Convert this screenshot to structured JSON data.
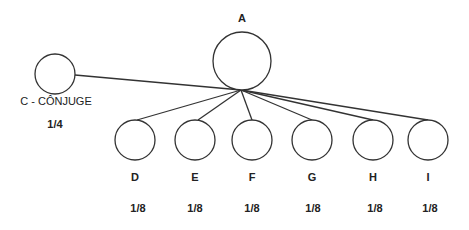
{
  "diagram": {
    "type": "inheritance-tree",
    "colors": {
      "stroke": "#333333",
      "text": "#222222",
      "background": "#ffffff"
    },
    "root": {
      "id": "A",
      "label": "A"
    },
    "spouse": {
      "id": "C",
      "label": "C - CÔNJUGE",
      "share": "1/4"
    },
    "children": [
      {
        "id": "D",
        "label": "D",
        "share": "1/8"
      },
      {
        "id": "E",
        "label": "E",
        "share": "1/8"
      },
      {
        "id": "F",
        "label": "F",
        "share": "1/8"
      },
      {
        "id": "G",
        "label": "G",
        "share": "1/8"
      },
      {
        "id": "H",
        "label": "H",
        "share": "1/8"
      },
      {
        "id": "I",
        "label": "I",
        "share": "1/8"
      }
    ]
  }
}
